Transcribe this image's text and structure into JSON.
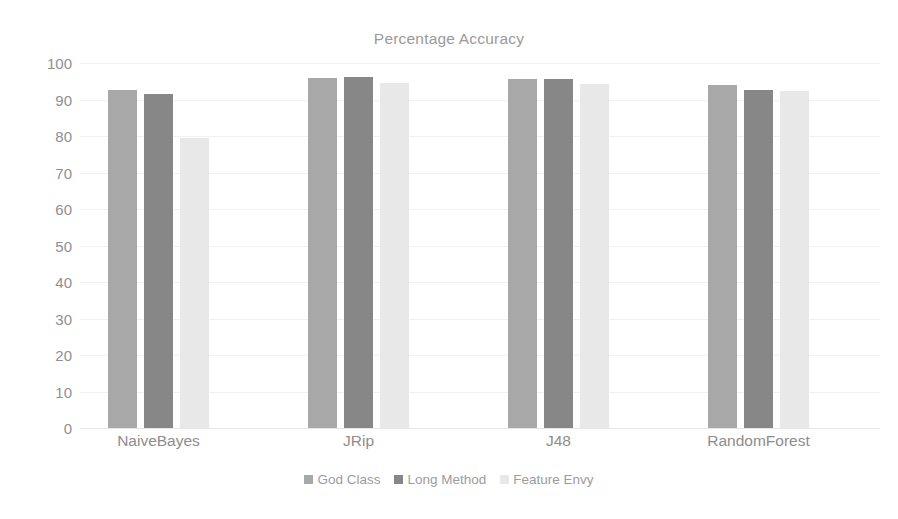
{
  "chart_data": {
    "type": "bar",
    "title": "Percentage Accuracy",
    "xlabel": "",
    "ylabel": "",
    "ylim": [
      0,
      100
    ],
    "ytick_step": 10,
    "grid": true,
    "legend_position": "bottom",
    "categories": [
      "NaiveBayes",
      "JRip",
      "J48",
      "RandomForest"
    ],
    "yticks": [
      "100",
      "90",
      "80",
      "70",
      "60",
      "50",
      "40",
      "30",
      "20",
      "10",
      "0"
    ],
    "series": [
      {
        "name": "God Class",
        "color": "#a8a8a8",
        "values": [
          92.5,
          96.0,
          95.5,
          94.0
        ]
      },
      {
        "name": "Long Method",
        "color": "#878787",
        "values": [
          91.5,
          96.3,
          95.5,
          92.5
        ]
      },
      {
        "name": "Feature Envy",
        "color": "#e8e8e8",
        "values": [
          79.5,
          94.5,
          94.3,
          92.3
        ]
      }
    ]
  },
  "style": {
    "title_color": "#9a9a9a",
    "tick_color": "#8f8f8f",
    "legend_text_color": "#9c9c9c",
    "gridline_color": "#f1f1f1",
    "baseline_color": "#e6e6e6",
    "background": "#ffffff"
  }
}
